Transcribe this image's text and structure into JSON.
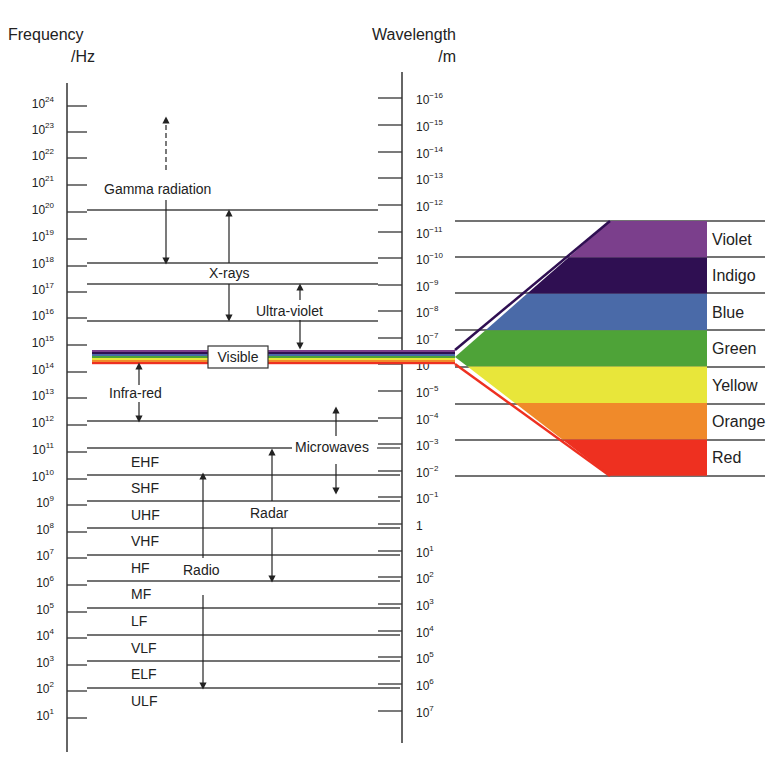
{
  "title_fragment": "g      p",
  "left_axis": {
    "title_line1": "Frequency",
    "title_line2": "/Hz",
    "ticks": [
      {
        "exp": "24",
        "y": 106
      },
      {
        "exp": "23",
        "y": 132
      },
      {
        "exp": "22",
        "y": 158
      },
      {
        "exp": "21",
        "y": 185
      },
      {
        "exp": "20",
        "y": 212
      },
      {
        "exp": "19",
        "y": 239
      },
      {
        "exp": "18",
        "y": 266
      },
      {
        "exp": "17",
        "y": 292
      },
      {
        "exp": "16",
        "y": 318
      },
      {
        "exp": "15",
        "y": 345
      },
      {
        "exp": "14",
        "y": 372
      },
      {
        "exp": "13",
        "y": 398
      },
      {
        "exp": "12",
        "y": 425
      },
      {
        "exp": "11",
        "y": 452
      },
      {
        "exp": "10",
        "y": 479
      },
      {
        "exp": "9",
        "y": 505
      },
      {
        "exp": "8",
        "y": 532
      },
      {
        "exp": "7",
        "y": 558
      },
      {
        "exp": "6",
        "y": 585
      },
      {
        "exp": "5",
        "y": 612
      },
      {
        "exp": "4",
        "y": 638
      },
      {
        "exp": "3",
        "y": 665
      },
      {
        "exp": "2",
        "y": 691
      },
      {
        "exp": "1",
        "y": 718
      }
    ]
  },
  "right_axis": {
    "title_line1": "Wavelength",
    "title_line2": "/m",
    "ticks": [
      {
        "base": "10",
        "exp": "−16",
        "y": 98
      },
      {
        "base": "10",
        "exp": "−15",
        "y": 125
      },
      {
        "base": "10",
        "exp": "−14",
        "y": 152
      },
      {
        "base": "10",
        "exp": "−13",
        "y": 178
      },
      {
        "base": "10",
        "exp": "−12",
        "y": 205
      },
      {
        "base": "10",
        "exp": "−11",
        "y": 232
      },
      {
        "base": "10",
        "exp": "−10",
        "y": 258
      },
      {
        "base": "10",
        "exp": "−9",
        "y": 285
      },
      {
        "base": "10",
        "exp": "−8",
        "y": 311
      },
      {
        "base": "10",
        "exp": "−7",
        "y": 338
      },
      {
        "base": "10",
        "exp": "−6",
        "y": 364
      },
      {
        "base": "10",
        "exp": "−5",
        "y": 391
      },
      {
        "base": "10",
        "exp": "−4",
        "y": 418
      },
      {
        "base": "10",
        "exp": "−3",
        "y": 444
      },
      {
        "base": "10",
        "exp": "−2",
        "y": 471
      },
      {
        "base": "10",
        "exp": "−1",
        "y": 497
      },
      {
        "base": "1",
        "exp": "",
        "y": 524
      },
      {
        "base": "10",
        "exp": "1",
        "y": 551
      },
      {
        "base": "10",
        "exp": "2",
        "y": 577
      },
      {
        "base": "10",
        "exp": "3",
        "y": 604
      },
      {
        "base": "10",
        "exp": "4",
        "y": 631
      },
      {
        "base": "10",
        "exp": "5",
        "y": 657
      },
      {
        "base": "10",
        "exp": "6",
        "y": 684
      },
      {
        "base": "10",
        "exp": "7",
        "y": 711
      }
    ]
  },
  "regions": {
    "gamma": "Gamma radiation",
    "xrays": "X-rays",
    "uv": "Ultra-violet",
    "visible": "Visible",
    "ir": "Infra-red",
    "microwaves": "Microwaves",
    "radar": "Radar",
    "radio": "Radio"
  },
  "radio_bands": [
    "EHF",
    "SHF",
    "UHF",
    "VHF",
    "HF",
    "MF",
    "LF",
    "VLF",
    "ELF",
    "ULF"
  ],
  "visible_colors": [
    {
      "name": "Violet",
      "color": "#7b3f8c"
    },
    {
      "name": "Indigo",
      "color": "#2f0f52"
    },
    {
      "name": "Blue",
      "color": "#4a6aa8"
    },
    {
      "name": "Green",
      "color": "#4ea338"
    },
    {
      "name": "Yellow",
      "color": "#e8e63a"
    },
    {
      "name": "Orange",
      "color": "#f08a2a"
    },
    {
      "name": "Red",
      "color": "#ee3020"
    }
  ]
}
